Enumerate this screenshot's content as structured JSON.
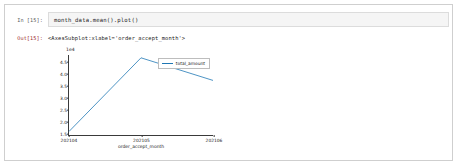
{
  "cell": {
    "input_prompt": "In [15]:",
    "output_prompt": "Out[15]:",
    "code": "month_data.mean().plot()",
    "output_text": "<AxesSubplot:xlabel='order_accept_month'>"
  },
  "chart_data": {
    "type": "line",
    "title": "",
    "xlabel": "order_accept_month",
    "ylabel": "",
    "y_offset_label": "1e4",
    "grid": false,
    "legend_position": "upper right",
    "categories": [
      "202104",
      "202105",
      "202106"
    ],
    "x_tick_labels": [
      "202104",
      "202105",
      "202106"
    ],
    "y_tick_labels": [
      "1.5",
      "2.0",
      "2.5",
      "3.0",
      "3.5",
      "4.0",
      "4.5"
    ],
    "ylim": [
      1.4,
      4.8
    ],
    "line_color": "#1f77b4",
    "series": [
      {
        "name": "total_amount",
        "x": [
          "202104",
          "202105",
          "202106"
        ],
        "values": [
          1.55,
          4.68,
          3.72
        ]
      }
    ]
  },
  "legend": {
    "entries": [
      {
        "label": "total_amount",
        "color": "#1f77b4"
      }
    ]
  }
}
